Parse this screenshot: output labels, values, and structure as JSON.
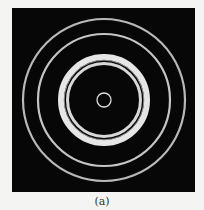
{
  "figure": {
    "type": "diffraction-ring-pattern",
    "caption": "(a)",
    "background_color": "#070707",
    "center": {
      "x": 92,
      "y": 92
    },
    "rings": [
      {
        "name": "outer-ring",
        "r": 81,
        "width": 2.2,
        "color": "#b8b8b8"
      },
      {
        "name": "second-ring",
        "r": 66,
        "width": 2.2,
        "color": "#c4c4c4"
      },
      {
        "name": "bright-band-outer",
        "r": 43,
        "width": 6,
        "color": "#e6e6e6"
      },
      {
        "name": "bright-band-inner",
        "r": 36.5,
        "width": 3,
        "color": "#d8d8d8"
      },
      {
        "name": "band-dark-line",
        "r": 39.8,
        "width": 1,
        "color": "#8a8a8a"
      },
      {
        "name": "center-ring",
        "r": 7,
        "width": 1.3,
        "color": "#dcdcdc"
      }
    ]
  }
}
